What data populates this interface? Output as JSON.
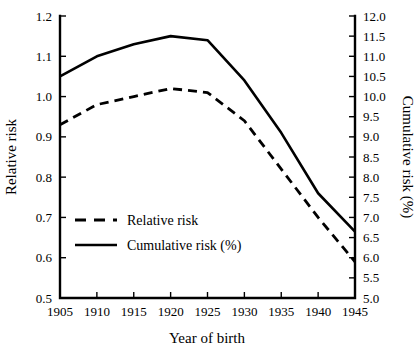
{
  "chart_data": {
    "type": "line",
    "title": "",
    "subtitle": "",
    "xlabel": "Year of birth",
    "ylabel": "Relative risk",
    "y2label": "Cumulative risk (%)",
    "grid": false,
    "legend_position": "inside-lower-left",
    "xlim": [
      1905,
      1945
    ],
    "ylim": [
      0.5,
      1.2
    ],
    "y2lim": [
      5.0,
      12.0
    ],
    "xticks": [
      1905,
      1910,
      1915,
      1920,
      1925,
      1930,
      1935,
      1940,
      1945
    ],
    "xtick_labels": [
      "1905",
      "1910",
      "1915",
      "1920",
      "1925",
      "1930",
      "1935",
      "1940",
      "1945"
    ],
    "yticks": [
      0.5,
      0.6,
      0.7,
      0.8,
      0.9,
      1.0,
      1.1,
      1.2
    ],
    "ytick_labels": [
      "0.5",
      "0.6",
      "0.7",
      "0.8",
      "0.9",
      "1.0",
      "1.1",
      "1.2"
    ],
    "y2ticks": [
      5.0,
      5.5,
      6.0,
      6.5,
      7.0,
      7.5,
      8.0,
      8.5,
      9.0,
      9.5,
      10.0,
      10.5,
      11.0,
      11.5,
      12.0
    ],
    "y2tick_labels": [
      "5.0",
      "5.5",
      "6.0",
      "6.5",
      "7.0",
      "7.5",
      "8.0",
      "8.5",
      "9.0",
      "9.5",
      "10.0",
      "10.5",
      "11.0",
      "11.5",
      "12.0"
    ],
    "x": [
      1905,
      1910,
      1915,
      1920,
      1925,
      1930,
      1935,
      1940,
      1945
    ],
    "series": [
      {
        "name": "Relative risk",
        "axis": "left",
        "style": "dashed",
        "color": "#000000",
        "values": [
          0.93,
          0.98,
          1.0,
          1.02,
          1.01,
          0.94,
          0.82,
          0.7,
          0.59
        ]
      },
      {
        "name": "Cumulative risk (%)",
        "axis": "right",
        "style": "solid",
        "color": "#000000",
        "values": [
          10.5,
          11.0,
          11.3,
          11.5,
          11.4,
          10.4,
          9.1,
          7.6,
          6.65
        ]
      }
    ],
    "legend": [
      {
        "label": "Relative risk",
        "style": "dashed"
      },
      {
        "label": "Cumulative risk (%)",
        "style": "solid"
      }
    ]
  }
}
